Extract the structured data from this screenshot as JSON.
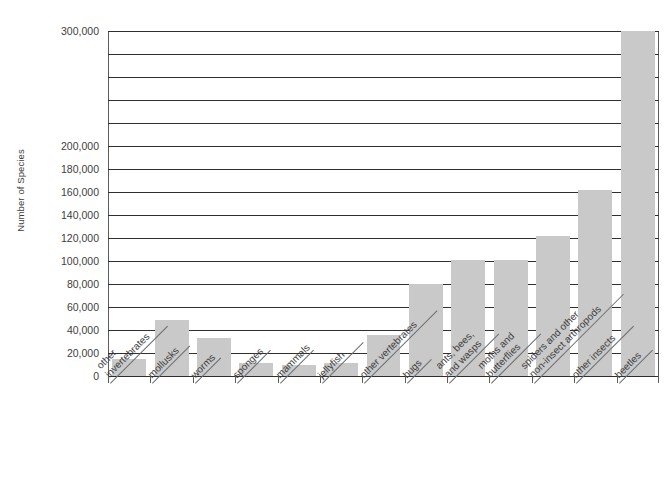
{
  "chart_data": {
    "type": "bar",
    "title": "",
    "subtitle": "",
    "xlabel": "",
    "ylabel": "Number of Species",
    "ylim": [
      0,
      300000
    ],
    "ytick_step": 20000,
    "grid": true,
    "legend": null,
    "bar_color": "#c9c9c9",
    "axis_color": "#2f2f2f",
    "categories": [
      "other invertebrates",
      "mollusks",
      "worms",
      "sponges",
      "mammals",
      "jellyfish",
      "other vertebrates",
      "bugs",
      "ants, bees, and wasps",
      "moths and butterflies",
      "spiders and other non-insect arthropods",
      "other insects",
      "beetles"
    ],
    "category_lines": [
      [
        "other",
        "invertebrates"
      ],
      [
        "mollusks"
      ],
      [
        "worms"
      ],
      [
        "sponges"
      ],
      [
        "mammals"
      ],
      [
        "jellyfish"
      ],
      [
        "other vertebrates"
      ],
      [
        "bugs"
      ],
      [
        "ants, bees,",
        "and wasps"
      ],
      [
        "moths and",
        "butterflies"
      ],
      [
        "spiders and other",
        "non-insect arthropods"
      ],
      [
        "other insects"
      ],
      [
        "beetles"
      ]
    ],
    "values": [
      15000,
      49000,
      33000,
      11000,
      10000,
      11000,
      36000,
      80000,
      101000,
      101000,
      122000,
      162000,
      300000
    ],
    "ytick_labels": [
      "300,000",
      "",
      "",
      "",
      "",
      "200,000",
      "180,000",
      "160,000",
      "140,000",
      "120,000",
      "100,000",
      "80,000",
      "60,000",
      "40,000",
      "20,000",
      "0"
    ],
    "ytick_values": [
      300000,
      280000,
      260000,
      240000,
      220000,
      200000,
      180000,
      160000,
      140000,
      120000,
      100000,
      80000,
      60000,
      40000,
      20000,
      0
    ]
  }
}
